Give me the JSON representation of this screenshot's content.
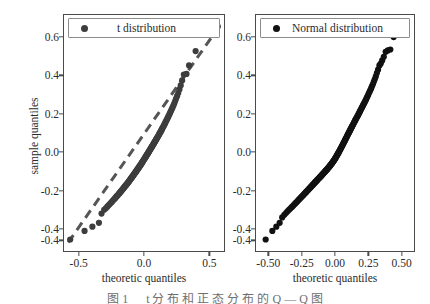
{
  "figure": {
    "background": "#ffffff",
    "width": 430,
    "height": 304,
    "caption": "图 1 　 t 分 布 和 正 态 分 布 的 Q — Q 图"
  },
  "axis_titles": {
    "y": "sample quantiles",
    "x": "theoretic quantiles"
  },
  "chart_data": [
    {
      "type": "scatter",
      "panel": "left",
      "title": "",
      "legend": "t distribution",
      "legend_position": "upper left",
      "xlabel": "theoretic quantiles",
      "ylabel": "sample quantiles",
      "xlim": [
        -0.62,
        0.62
      ],
      "ylim": [
        -0.52,
        0.72
      ],
      "xticks": [
        -0.5,
        0.0,
        0.5
      ],
      "xticklabels": [
        "-0.5",
        "0.0",
        "0.5"
      ],
      "yticks": [
        0.6,
        0.4,
        0.2,
        0.0,
        -0.2,
        -0.4,
        -0.46
      ],
      "yticklabels": [
        "0.6",
        "0.4",
        "0.2",
        "0.0",
        "-0.2",
        "-0.4",
        "-0.4"
      ],
      "grid": false,
      "marker_color": "#3d3d3d",
      "marker_size": 5,
      "reference_line": {
        "style": "dashed",
        "color": "#555555",
        "width": 3,
        "x": [
          -0.58,
          0.58
        ],
        "y": [
          -0.47,
          0.66
        ]
      },
      "x": [
        -0.565,
        -0.455,
        -0.395,
        -0.345,
        -0.325,
        -0.305,
        -0.292,
        -0.281,
        -0.271,
        -0.262,
        -0.253,
        -0.245,
        -0.238,
        -0.231,
        -0.224,
        -0.218,
        -0.212,
        -0.206,
        -0.2,
        -0.195,
        -0.19,
        -0.185,
        -0.18,
        -0.175,
        -0.171,
        -0.166,
        -0.162,
        -0.158,
        -0.154,
        -0.15,
        -0.146,
        -0.142,
        -0.138,
        -0.135,
        -0.131,
        -0.128,
        -0.124,
        -0.121,
        -0.117,
        -0.114,
        -0.111,
        -0.108,
        -0.104,
        -0.101,
        -0.098,
        -0.095,
        -0.092,
        -0.089,
        -0.086,
        -0.083,
        -0.08,
        -0.077,
        -0.075,
        -0.072,
        -0.069,
        -0.066,
        -0.063,
        -0.061,
        -0.058,
        -0.055,
        -0.053,
        -0.05,
        -0.047,
        -0.045,
        -0.042,
        -0.039,
        -0.037,
        -0.034,
        -0.032,
        -0.029,
        -0.026,
        -0.024,
        -0.021,
        -0.019,
        -0.016,
        -0.014,
        -0.011,
        -0.009,
        -0.006,
        -0.004,
        0.0,
        0.004,
        0.006,
        0.009,
        0.011,
        0.014,
        0.016,
        0.019,
        0.021,
        0.024,
        0.026,
        0.029,
        0.032,
        0.034,
        0.037,
        0.039,
        0.042,
        0.045,
        0.047,
        0.05,
        0.053,
        0.055,
        0.058,
        0.061,
        0.063,
        0.066,
        0.069,
        0.072,
        0.075,
        0.077,
        0.08,
        0.083,
        0.086,
        0.089,
        0.092,
        0.095,
        0.098,
        0.101,
        0.104,
        0.108,
        0.111,
        0.114,
        0.117,
        0.121,
        0.124,
        0.128,
        0.131,
        0.135,
        0.138,
        0.142,
        0.146,
        0.15,
        0.154,
        0.158,
        0.162,
        0.166,
        0.171,
        0.175,
        0.18,
        0.185,
        0.19,
        0.195,
        0.2,
        0.206,
        0.212,
        0.218,
        0.224,
        0.231,
        0.238,
        0.245,
        0.253,
        0.262,
        0.271,
        0.281,
        0.292,
        0.305,
        0.325,
        0.345,
        0.395,
        0.455,
        0.565
      ],
      "y": [
        -0.455,
        -0.41,
        -0.388,
        -0.368,
        -0.32,
        -0.3,
        -0.292,
        -0.284,
        -0.277,
        -0.27,
        -0.264,
        -0.258,
        -0.252,
        -0.247,
        -0.242,
        -0.237,
        -0.232,
        -0.228,
        -0.223,
        -0.219,
        -0.215,
        -0.211,
        -0.207,
        -0.203,
        -0.199,
        -0.196,
        -0.192,
        -0.189,
        -0.185,
        -0.182,
        -0.178,
        -0.175,
        -0.172,
        -0.169,
        -0.166,
        -0.163,
        -0.16,
        -0.157,
        -0.154,
        -0.151,
        -0.148,
        -0.145,
        -0.142,
        -0.139,
        -0.136,
        -0.133,
        -0.13,
        -0.127,
        -0.125,
        -0.122,
        -0.119,
        -0.116,
        -0.114,
        -0.111,
        -0.108,
        -0.106,
        -0.103,
        -0.1,
        -0.098,
        -0.095,
        -0.092,
        -0.09,
        -0.087,
        -0.085,
        -0.082,
        -0.079,
        -0.077,
        -0.074,
        -0.072,
        -0.069,
        -0.066,
        -0.064,
        -0.061,
        -0.058,
        -0.056,
        -0.053,
        -0.05,
        -0.048,
        -0.045,
        -0.042,
        -0.038,
        -0.034,
        -0.032,
        -0.029,
        -0.026,
        -0.023,
        -0.021,
        -0.018,
        -0.015,
        -0.012,
        -0.01,
        -0.007,
        -0.004,
        -0.001,
        0.002,
        0.005,
        0.008,
        0.011,
        0.014,
        0.017,
        0.02,
        0.023,
        0.026,
        0.029,
        0.032,
        0.035,
        0.038,
        0.041,
        0.045,
        0.048,
        0.051,
        0.054,
        0.058,
        0.061,
        0.065,
        0.068,
        0.072,
        0.075,
        0.079,
        0.083,
        0.087,
        0.091,
        0.095,
        0.099,
        0.103,
        0.107,
        0.112,
        0.116,
        0.121,
        0.126,
        0.131,
        0.136,
        0.141,
        0.147,
        0.152,
        0.158,
        0.164,
        0.17,
        0.177,
        0.184,
        0.191,
        0.198,
        0.206,
        0.214,
        0.223,
        0.232,
        0.242,
        0.253,
        0.265,
        0.278,
        0.292,
        0.308,
        0.327,
        0.348,
        0.374,
        0.404,
        0.408,
        0.452,
        0.527,
        0.65,
        0.655
      ]
    },
    {
      "type": "scatter",
      "panel": "right",
      "title": "",
      "legend": "Normal distribution",
      "legend_position": "upper left",
      "xlabel": "theoretic quantiles",
      "ylabel": "",
      "xlim": [
        -0.6,
        0.6
      ],
      "ylim": [
        -0.52,
        0.72
      ],
      "xticks": [
        -0.5,
        -0.25,
        0.0,
        0.25,
        0.5
      ],
      "xticklabels": [
        "-0.50",
        "-0.25",
        "0.00",
        "0.25",
        "0.50"
      ],
      "yticks": [
        0.6,
        0.4,
        0.2,
        0.0,
        -0.2,
        -0.4,
        -0.46
      ],
      "yticklabels": [
        "0.6",
        "0.4",
        "0.2",
        "0.0",
        "-0.2",
        "-0.4",
        "-0.4"
      ],
      "grid": false,
      "marker_color": "#111111",
      "marker_size": 5,
      "reference_line": null,
      "x": [
        -0.52,
        -0.47,
        -0.44,
        -0.415,
        -0.396,
        -0.38,
        -0.366,
        -0.354,
        -0.343,
        -0.333,
        -0.323,
        -0.314,
        -0.306,
        -0.298,
        -0.291,
        -0.284,
        -0.277,
        -0.271,
        -0.264,
        -0.258,
        -0.252,
        -0.247,
        -0.241,
        -0.236,
        -0.231,
        -0.226,
        -0.221,
        -0.216,
        -0.211,
        -0.207,
        -0.202,
        -0.198,
        -0.193,
        -0.189,
        -0.185,
        -0.181,
        -0.177,
        -0.173,
        -0.169,
        -0.165,
        -0.161,
        -0.157,
        -0.153,
        -0.15,
        -0.146,
        -0.142,
        -0.139,
        -0.135,
        -0.132,
        -0.128,
        -0.125,
        -0.121,
        -0.118,
        -0.114,
        -0.111,
        -0.108,
        -0.104,
        -0.101,
        -0.098,
        -0.094,
        -0.091,
        -0.088,
        -0.085,
        -0.081,
        -0.078,
        -0.075,
        -0.072,
        -0.069,
        -0.065,
        -0.062,
        -0.059,
        -0.056,
        -0.053,
        -0.05,
        -0.046,
        -0.043,
        -0.04,
        -0.037,
        -0.034,
        -0.031,
        -0.028,
        -0.024,
        -0.021,
        -0.018,
        -0.015,
        -0.012,
        -0.009,
        -0.006,
        -0.003,
        0.0,
        0.003,
        0.006,
        0.009,
        0.012,
        0.015,
        0.018,
        0.021,
        0.024,
        0.028,
        0.031,
        0.034,
        0.037,
        0.04,
        0.043,
        0.046,
        0.05,
        0.053,
        0.056,
        0.059,
        0.062,
        0.065,
        0.069,
        0.072,
        0.075,
        0.078,
        0.081,
        0.085,
        0.088,
        0.091,
        0.094,
        0.098,
        0.101,
        0.104,
        0.108,
        0.111,
        0.114,
        0.118,
        0.121,
        0.125,
        0.128,
        0.132,
        0.135,
        0.139,
        0.142,
        0.146,
        0.15,
        0.153,
        0.157,
        0.161,
        0.165,
        0.169,
        0.173,
        0.177,
        0.181,
        0.185,
        0.189,
        0.193,
        0.198,
        0.202,
        0.207,
        0.211,
        0.216,
        0.221,
        0.226,
        0.231,
        0.236,
        0.241,
        0.247,
        0.252,
        0.258,
        0.264,
        0.271,
        0.277,
        0.284,
        0.291,
        0.298,
        0.306,
        0.314,
        0.323,
        0.333,
        0.343,
        0.354,
        0.366,
        0.38,
        0.396,
        0.415,
        0.44,
        0.47,
        0.52
      ],
      "y": [
        -0.455,
        -0.41,
        -0.388,
        -0.368,
        -0.34,
        -0.326,
        -0.316,
        -0.307,
        -0.299,
        -0.292,
        -0.285,
        -0.279,
        -0.273,
        -0.267,
        -0.262,
        -0.257,
        -0.252,
        -0.247,
        -0.243,
        -0.238,
        -0.234,
        -0.23,
        -0.226,
        -0.222,
        -0.218,
        -0.214,
        -0.211,
        -0.207,
        -0.204,
        -0.2,
        -0.197,
        -0.193,
        -0.19,
        -0.187,
        -0.184,
        -0.181,
        -0.178,
        -0.175,
        -0.172,
        -0.169,
        -0.166,
        -0.163,
        -0.16,
        -0.157,
        -0.155,
        -0.152,
        -0.149,
        -0.147,
        -0.144,
        -0.141,
        -0.139,
        -0.136,
        -0.134,
        -0.131,
        -0.129,
        -0.126,
        -0.124,
        -0.121,
        -0.119,
        -0.116,
        -0.114,
        -0.111,
        -0.109,
        -0.106,
        -0.104,
        -0.101,
        -0.099,
        -0.096,
        -0.094,
        -0.091,
        -0.089,
        -0.086,
        -0.084,
        -0.081,
        -0.078,
        -0.076,
        -0.073,
        -0.07,
        -0.068,
        -0.065,
        -0.062,
        -0.059,
        -0.056,
        -0.053,
        -0.05,
        -0.047,
        -0.044,
        -0.041,
        -0.038,
        -0.034,
        -0.031,
        -0.027,
        -0.024,
        -0.02,
        -0.016,
        -0.013,
        -0.009,
        -0.005,
        -0.001,
        0.003,
        0.007,
        0.011,
        0.015,
        0.019,
        0.023,
        0.028,
        0.032,
        0.036,
        0.04,
        0.045,
        0.049,
        0.053,
        0.058,
        0.062,
        0.066,
        0.071,
        0.075,
        0.08,
        0.084,
        0.089,
        0.093,
        0.098,
        0.102,
        0.107,
        0.111,
        0.116,
        0.12,
        0.125,
        0.13,
        0.134,
        0.139,
        0.144,
        0.148,
        0.153,
        0.158,
        0.163,
        0.168,
        0.173,
        0.178,
        0.183,
        0.188,
        0.193,
        0.199,
        0.204,
        0.21,
        0.215,
        0.221,
        0.227,
        0.233,
        0.239,
        0.245,
        0.252,
        0.258,
        0.265,
        0.272,
        0.28,
        0.287,
        0.295,
        0.304,
        0.313,
        0.322,
        0.332,
        0.343,
        0.354,
        0.367,
        0.38,
        0.395,
        0.412,
        0.43,
        0.452,
        0.462,
        0.478,
        0.497,
        0.523,
        0.53,
        0.535,
        0.6,
        0.64,
        0.655
      ]
    }
  ]
}
